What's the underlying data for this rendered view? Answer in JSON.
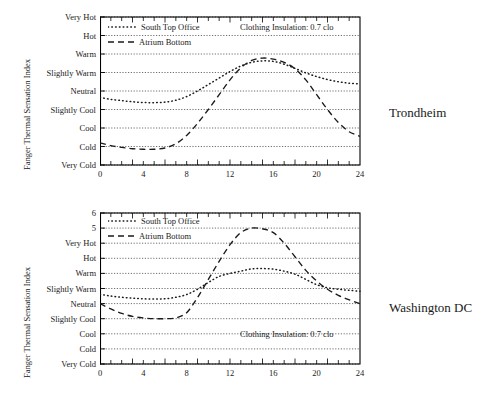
{
  "figure": {
    "axis_title_y": "Fanger Thermal Sensation Index",
    "legend": {
      "series1": "South Top Office",
      "series2": "Atrium Bottom"
    },
    "annotation": "Clothing Insulation: 0.7 clo",
    "colors": {
      "ink": "#1a1a1a",
      "grid": "#555555",
      "axis": "#000000"
    }
  },
  "panels": [
    {
      "site": "Trondheim",
      "x_ticks": [
        "0",
        "4",
        "8",
        "12",
        "16",
        "20",
        "24"
      ],
      "y_ticks": [
        "Very Hot",
        "Hot",
        "Warm",
        "Slightly Warm",
        "Neutral",
        "Slightly Cool",
        "Cool",
        "Cold",
        "Very Cold"
      ]
    },
    {
      "site": "Washington DC",
      "x_ticks": [
        "0",
        "4",
        "8",
        "12",
        "16",
        "20",
        "24"
      ],
      "y_ticks": [
        "6",
        "5",
        "Very Hot",
        "Hot",
        "Warm",
        "Slightly Warm",
        "Neutral",
        "Slightly Cool",
        "Cool",
        "Cold",
        "Very Cold"
      ]
    }
  ],
  "chart_data": [
    {
      "type": "line",
      "title": "Trondheim",
      "xlabel": "",
      "ylabel": "Fanger Thermal Sensation Index",
      "xlim": [
        0,
        24
      ],
      "ylim": [
        -4,
        4
      ],
      "x_ticks": [
        0,
        4,
        8,
        12,
        16,
        20,
        24
      ],
      "x_minor_tick_step": 1,
      "y_tick_values": [
        4,
        3,
        2,
        1,
        0,
        -1,
        -2,
        -3,
        -4
      ],
      "y_tick_labels": [
        "Very Hot",
        "Hot",
        "Warm",
        "Slightly Warm",
        "Neutral",
        "Slightly Cool",
        "Cool",
        "Cold",
        "Very Cold"
      ],
      "grid": "horizontal dotted",
      "legend_position": "top-left inside",
      "annotations": [
        "Clothing Insulation: 0.7 clo"
      ],
      "x": [
        0,
        1,
        2,
        3,
        4,
        5,
        6,
        7,
        8,
        9,
        10,
        11,
        12,
        13,
        14,
        15,
        16,
        17,
        18,
        19,
        20,
        21,
        22,
        23,
        24
      ],
      "series": [
        {
          "name": "South Top Office",
          "style": "dotted",
          "values": [
            -0.35,
            -0.45,
            -0.52,
            -0.58,
            -0.62,
            -0.63,
            -0.6,
            -0.5,
            -0.3,
            0.0,
            0.35,
            0.7,
            1.05,
            1.35,
            1.55,
            1.63,
            1.6,
            1.45,
            1.22,
            0.98,
            0.78,
            0.62,
            0.5,
            0.42,
            0.38
          ]
        },
        {
          "name": "Atrium Bottom",
          "style": "dashed",
          "values": [
            -2.8,
            -2.95,
            -3.05,
            -3.12,
            -3.15,
            -3.15,
            -3.08,
            -2.85,
            -2.4,
            -1.75,
            -1.0,
            -0.2,
            0.6,
            1.25,
            1.65,
            1.78,
            1.72,
            1.55,
            1.2,
            0.6,
            -0.2,
            -1.0,
            -1.7,
            -2.2,
            -2.45
          ]
        }
      ]
    },
    {
      "type": "line",
      "title": "Washington DC",
      "xlabel": "",
      "ylabel": "Fanger Thermal Sensation Index",
      "xlim": [
        0,
        24
      ],
      "ylim": [
        -4,
        6
      ],
      "x_ticks": [
        0,
        4,
        8,
        12,
        16,
        20,
        24
      ],
      "x_minor_tick_step": 1,
      "y_tick_values": [
        6,
        5,
        4,
        3,
        2,
        1,
        0,
        -1,
        -2,
        -3,
        -4
      ],
      "y_tick_labels": [
        "6",
        "5",
        "Very Hot",
        "Hot",
        "Warm",
        "Slightly Warm",
        "Neutral",
        "Slightly Cool",
        "Cool",
        "Cold",
        "Very Cold"
      ],
      "grid": "horizontal dotted",
      "legend_position": "top-left inside",
      "annotations": [
        "Clothing Insulation: 0.7 clo"
      ],
      "x": [
        0,
        1,
        2,
        3,
        4,
        5,
        6,
        7,
        8,
        9,
        10,
        11,
        12,
        13,
        14,
        15,
        16,
        17,
        18,
        19,
        20,
        21,
        22,
        23,
        24
      ],
      "series": [
        {
          "name": "South Top Office",
          "style": "dotted",
          "values": [
            0.62,
            0.5,
            0.42,
            0.36,
            0.32,
            0.3,
            0.32,
            0.42,
            0.6,
            0.95,
            1.4,
            1.8,
            2.0,
            2.15,
            2.3,
            2.32,
            2.28,
            2.15,
            1.95,
            1.6,
            1.25,
            1.05,
            0.95,
            0.88,
            0.82
          ]
        },
        {
          "name": "Atrium Bottom",
          "style": "dashed",
          "values": [
            0.0,
            -0.35,
            -0.65,
            -0.85,
            -0.95,
            -1.0,
            -1.0,
            -0.95,
            -0.6,
            0.4,
            1.6,
            2.8,
            3.9,
            4.7,
            5.0,
            4.95,
            4.7,
            4.0,
            3.1,
            2.2,
            1.5,
            0.95,
            0.55,
            0.25,
            0.0
          ]
        }
      ]
    }
  ]
}
